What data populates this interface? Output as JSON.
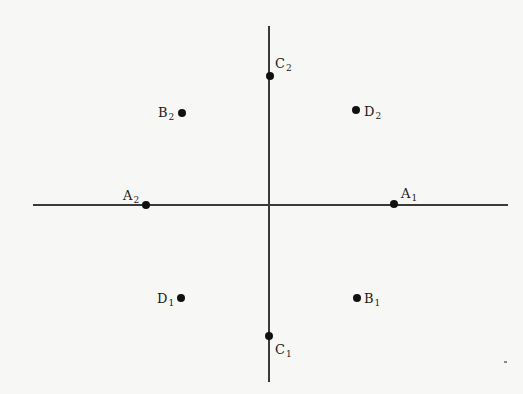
{
  "diagram": {
    "type": "coordinate-points",
    "axes": {
      "horizontal": {
        "x1": 33,
        "x2": 508,
        "y": 205
      },
      "vertical": {
        "x": 269,
        "y1": 26,
        "y2": 382
      }
    },
    "points": [
      {
        "id": "A1",
        "letter": "A",
        "sub": "1",
        "x": 394,
        "y": 204,
        "label_pos": "above-right"
      },
      {
        "id": "A2",
        "letter": "A",
        "sub": "2",
        "x": 146,
        "y": 205,
        "label_pos": "above-left"
      },
      {
        "id": "B1",
        "letter": "B",
        "sub": "1",
        "x": 357,
        "y": 298,
        "label_pos": "right"
      },
      {
        "id": "B2",
        "letter": "B",
        "sub": "2",
        "x": 182,
        "y": 113,
        "label_pos": "left"
      },
      {
        "id": "C1",
        "letter": "C",
        "sub": "1",
        "x": 269,
        "y": 336,
        "label_pos": "below-right"
      },
      {
        "id": "C2",
        "letter": "C",
        "sub": "2",
        "x": 270,
        "y": 76,
        "label_pos": "above-right"
      },
      {
        "id": "D1",
        "letter": "D",
        "sub": "1",
        "x": 181,
        "y": 298,
        "label_pos": "left"
      },
      {
        "id": "D2",
        "letter": "D",
        "sub": "2",
        "x": 356,
        "y": 110,
        "label_pos": "right"
      }
    ],
    "colors": {
      "background": "#f7f7f5",
      "axis": "#3a3a3a",
      "point": "#111111",
      "text": "#1a1a1a"
    }
  }
}
